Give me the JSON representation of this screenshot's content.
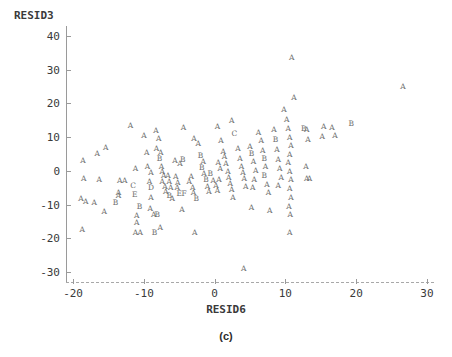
{
  "figure": {
    "caption": "(c)",
    "ylabel": "RESID3",
    "xlabel": "RESID6"
  },
  "chart_data": {
    "type": "scatter",
    "title": "",
    "subtitle": "",
    "caption": "(c)",
    "xlabel": "RESID6",
    "ylabel": "RESID3",
    "xlim": [
      -21,
      31
    ],
    "ylim": [
      -33,
      43
    ],
    "xticks": [
      -20,
      -10,
      0,
      10,
      20,
      30
    ],
    "yticks": [
      -30,
      -20,
      -10,
      0,
      10,
      20,
      30,
      40
    ],
    "xtick_labels": [
      "-20",
      "-10",
      "0",
      "10",
      "20",
      "30"
    ],
    "ytick_labels": [
      "-30",
      "-20",
      "-10",
      "0",
      "10",
      "20",
      "30",
      "40"
    ],
    "grid": false,
    "legend": "none",
    "marker_style": "letter-coded-count",
    "marker_letters": [
      "A",
      "B",
      "C",
      "D",
      "E",
      "F"
    ],
    "marker_letter_meaning": "A=1 observation, B=2, C=3, D=4, E=5, F=6 overlapping observations",
    "xaxis_style": "dashed",
    "yaxis_style": "solid",
    "points": [
      {
        "x": -18.6,
        "y": 3.0,
        "label": "A"
      },
      {
        "x": -16.6,
        "y": 5.0,
        "label": "A"
      },
      {
        "x": -15.4,
        "y": 6.8,
        "label": "A"
      },
      {
        "x": -18.5,
        "y": -2.5,
        "label": "A"
      },
      {
        "x": -16.3,
        "y": -2.7,
        "label": "A"
      },
      {
        "x": -18.9,
        "y": -8.3,
        "label": "A"
      },
      {
        "x": -18.2,
        "y": -9.3,
        "label": "A"
      },
      {
        "x": -17.0,
        "y": -9.4,
        "label": "A"
      },
      {
        "x": -15.6,
        "y": -12.3,
        "label": "A"
      },
      {
        "x": -18.7,
        "y": -17.6,
        "label": "A"
      },
      {
        "x": -13.4,
        "y": -3.0,
        "label": "A"
      },
      {
        "x": -12.7,
        "y": -3.0,
        "label": "A"
      },
      {
        "x": -13.6,
        "y": -6.5,
        "label": "A"
      },
      {
        "x": -13.6,
        "y": -7.6,
        "label": "A"
      },
      {
        "x": -14.0,
        "y": -9.4,
        "label": "B"
      },
      {
        "x": -11.2,
        "y": 0.6,
        "label": "A"
      },
      {
        "x": -11.5,
        "y": -4.6,
        "label": "C"
      },
      {
        "x": -11.3,
        "y": -7.3,
        "label": "E"
      },
      {
        "x": -10.6,
        "y": -10.8,
        "label": "B"
      },
      {
        "x": -11.0,
        "y": -13.5,
        "label": "A"
      },
      {
        "x": -11.0,
        "y": -15.6,
        "label": "A"
      },
      {
        "x": -11.2,
        "y": -18.6,
        "label": "A"
      },
      {
        "x": -10.5,
        "y": -18.6,
        "label": "A"
      },
      {
        "x": -11.9,
        "y": 13.4,
        "label": "A"
      },
      {
        "x": -10.0,
        "y": 10.2,
        "label": "A"
      },
      {
        "x": -9.6,
        "y": 5.4,
        "label": "A"
      },
      {
        "x": -9.5,
        "y": 1.0,
        "label": "A"
      },
      {
        "x": -9.0,
        "y": -0.5,
        "label": "A"
      },
      {
        "x": -9.2,
        "y": -3.2,
        "label": "A"
      },
      {
        "x": -9.0,
        "y": -5.2,
        "label": "D"
      },
      {
        "x": -9.0,
        "y": -8.2,
        "label": "A"
      },
      {
        "x": -9.1,
        "y": -11.4,
        "label": "A"
      },
      {
        "x": -8.6,
        "y": -13.0,
        "label": "A"
      },
      {
        "x": -8.1,
        "y": -13.2,
        "label": "B"
      },
      {
        "x": -8.5,
        "y": -18.5,
        "label": "B"
      },
      {
        "x": -7.7,
        "y": -17.1,
        "label": "A"
      },
      {
        "x": -8.3,
        "y": 11.7,
        "label": "A"
      },
      {
        "x": -7.9,
        "y": 9.4,
        "label": "A"
      },
      {
        "x": -8.2,
        "y": 6.4,
        "label": "A"
      },
      {
        "x": -7.6,
        "y": 5.4,
        "label": "A"
      },
      {
        "x": -7.8,
        "y": 3.4,
        "label": "B"
      },
      {
        "x": -7.5,
        "y": 1.2,
        "label": "A"
      },
      {
        "x": -7.4,
        "y": -0.2,
        "label": "A"
      },
      {
        "x": -7.2,
        "y": -1.6,
        "label": "A"
      },
      {
        "x": -7.4,
        "y": -3.2,
        "label": "A"
      },
      {
        "x": -7.0,
        "y": -4.7,
        "label": "A"
      },
      {
        "x": -6.9,
        "y": -6.2,
        "label": "A"
      },
      {
        "x": -6.6,
        "y": -1.6,
        "label": "A"
      },
      {
        "x": -6.4,
        "y": -3.3,
        "label": "A"
      },
      {
        "x": -6.2,
        "y": -5.0,
        "label": "A"
      },
      {
        "x": -6.4,
        "y": -7.4,
        "label": "B"
      },
      {
        "x": -6.0,
        "y": -8.4,
        "label": "A"
      },
      {
        "x": -5.5,
        "y": -1.8,
        "label": "A"
      },
      {
        "x": -5.2,
        "y": -3.6,
        "label": "A"
      },
      {
        "x": -5.3,
        "y": -5.2,
        "label": "A"
      },
      {
        "x": -5.0,
        "y": -6.8,
        "label": "E"
      },
      {
        "x": -4.3,
        "y": -6.8,
        "label": "F"
      },
      {
        "x": -5.6,
        "y": 3.0,
        "label": "A"
      },
      {
        "x": -4.9,
        "y": 1.9,
        "label": "A"
      },
      {
        "x": -4.5,
        "y": 3.2,
        "label": "B"
      },
      {
        "x": -4.4,
        "y": 12.6,
        "label": "A"
      },
      {
        "x": -4.6,
        "y": -11.6,
        "label": "A"
      },
      {
        "x": -3.6,
        "y": -3.3,
        "label": "A"
      },
      {
        "x": -3.3,
        "y": -1.8,
        "label": "A"
      },
      {
        "x": -3.1,
        "y": -5.0,
        "label": "A"
      },
      {
        "x": -3.0,
        "y": -6.6,
        "label": "A"
      },
      {
        "x": -2.6,
        "y": -8.3,
        "label": "B"
      },
      {
        "x": -2.8,
        "y": -18.6,
        "label": "A"
      },
      {
        "x": -2.9,
        "y": 9.6,
        "label": "A"
      },
      {
        "x": -2.3,
        "y": 8.1,
        "label": "A"
      },
      {
        "x": -2.0,
        "y": 4.4,
        "label": "B"
      },
      {
        "x": -1.6,
        "y": 2.6,
        "label": "A"
      },
      {
        "x": -1.8,
        "y": 0.8,
        "label": "B"
      },
      {
        "x": -1.5,
        "y": -1.0,
        "label": "A"
      },
      {
        "x": -1.2,
        "y": -2.8,
        "label": "B"
      },
      {
        "x": -1.0,
        "y": -4.8,
        "label": "A"
      },
      {
        "x": -0.8,
        "y": -6.4,
        "label": "A"
      },
      {
        "x": -0.6,
        "y": -0.9,
        "label": "B"
      },
      {
        "x": -0.2,
        "y": -2.9,
        "label": "A"
      },
      {
        "x": 0.2,
        "y": -4.4,
        "label": "A"
      },
      {
        "x": 0.4,
        "y": -6.0,
        "label": "A"
      },
      {
        "x": 0.6,
        "y": -2.6,
        "label": "A"
      },
      {
        "x": 0.8,
        "y": 0.4,
        "label": "A"
      },
      {
        "x": 0.5,
        "y": 2.2,
        "label": "A"
      },
      {
        "x": 0.4,
        "y": 13.0,
        "label": "A"
      },
      {
        "x": 0.9,
        "y": 9.0,
        "label": "A"
      },
      {
        "x": 1.2,
        "y": 5.6,
        "label": "A"
      },
      {
        "x": 1.4,
        "y": 4.0,
        "label": "A"
      },
      {
        "x": 1.6,
        "y": 1.9,
        "label": "A"
      },
      {
        "x": 1.9,
        "y": -0.4,
        "label": "A"
      },
      {
        "x": 2.0,
        "y": -2.0,
        "label": "A"
      },
      {
        "x": 2.2,
        "y": -3.8,
        "label": "A"
      },
      {
        "x": 2.4,
        "y": -5.8,
        "label": "A"
      },
      {
        "x": 2.6,
        "y": -8.2,
        "label": "A"
      },
      {
        "x": 2.4,
        "y": 14.8,
        "label": "A"
      },
      {
        "x": 2.8,
        "y": 11.0,
        "label": "C"
      },
      {
        "x": 3.3,
        "y": 6.4,
        "label": "A"
      },
      {
        "x": 3.6,
        "y": 3.4,
        "label": "A"
      },
      {
        "x": 3.8,
        "y": 1.2,
        "label": "A"
      },
      {
        "x": 4.0,
        "y": -0.6,
        "label": "A"
      },
      {
        "x": 4.2,
        "y": -2.4,
        "label": "A"
      },
      {
        "x": 4.4,
        "y": -4.8,
        "label": "A"
      },
      {
        "x": 4.1,
        "y": -29.2,
        "label": "A"
      },
      {
        "x": 5.0,
        "y": 7.2,
        "label": "A"
      },
      {
        "x": 5.2,
        "y": 5.0,
        "label": "B"
      },
      {
        "x": 5.5,
        "y": 2.5,
        "label": "A"
      },
      {
        "x": 5.8,
        "y": 0.0,
        "label": "A"
      },
      {
        "x": 5.6,
        "y": -2.6,
        "label": "A"
      },
      {
        "x": 5.4,
        "y": -5.2,
        "label": "A"
      },
      {
        "x": 5.2,
        "y": -11.0,
        "label": "A"
      },
      {
        "x": 6.2,
        "y": 11.2,
        "label": "A"
      },
      {
        "x": 6.6,
        "y": 8.8,
        "label": "A"
      },
      {
        "x": 6.8,
        "y": 6.0,
        "label": "A"
      },
      {
        "x": 7.0,
        "y": 3.6,
        "label": "B"
      },
      {
        "x": 7.2,
        "y": 1.0,
        "label": "A"
      },
      {
        "x": 7.0,
        "y": -1.6,
        "label": "B"
      },
      {
        "x": 7.4,
        "y": -4.2,
        "label": "A"
      },
      {
        "x": 7.6,
        "y": -6.6,
        "label": "A"
      },
      {
        "x": 7.8,
        "y": -12.0,
        "label": "A"
      },
      {
        "x": 8.4,
        "y": 12.2,
        "label": "A"
      },
      {
        "x": 8.6,
        "y": 9.2,
        "label": "B"
      },
      {
        "x": 8.8,
        "y": 6.2,
        "label": "A"
      },
      {
        "x": 9.0,
        "y": 3.2,
        "label": "A"
      },
      {
        "x": 9.2,
        "y": 0.4,
        "label": "A"
      },
      {
        "x": 9.4,
        "y": -2.2,
        "label": "A"
      },
      {
        "x": 9.0,
        "y": -4.6,
        "label": "A"
      },
      {
        "x": 9.8,
        "y": 18.2,
        "label": "A"
      },
      {
        "x": 10.2,
        "y": 15.0,
        "label": "A"
      },
      {
        "x": 10.4,
        "y": 12.4,
        "label": "A"
      },
      {
        "x": 10.6,
        "y": 9.8,
        "label": "A"
      },
      {
        "x": 10.8,
        "y": 7.4,
        "label": "A"
      },
      {
        "x": 10.6,
        "y": 4.8,
        "label": "A"
      },
      {
        "x": 10.4,
        "y": 2.2,
        "label": "A"
      },
      {
        "x": 10.6,
        "y": -0.2,
        "label": "A"
      },
      {
        "x": 10.8,
        "y": -2.8,
        "label": "A"
      },
      {
        "x": 10.6,
        "y": -5.4,
        "label": "A"
      },
      {
        "x": 10.8,
        "y": -8.0,
        "label": "A"
      },
      {
        "x": 10.5,
        "y": -10.6,
        "label": "A"
      },
      {
        "x": 10.7,
        "y": -13.0,
        "label": "A"
      },
      {
        "x": 10.6,
        "y": -18.4,
        "label": "A"
      },
      {
        "x": 10.9,
        "y": 33.4,
        "label": "A"
      },
      {
        "x": 11.2,
        "y": 21.6,
        "label": "A"
      },
      {
        "x": 12.6,
        "y": 12.4,
        "label": "B"
      },
      {
        "x": 13.0,
        "y": 12.2,
        "label": "A"
      },
      {
        "x": 13.2,
        "y": 9.2,
        "label": "A"
      },
      {
        "x": 12.9,
        "y": 1.2,
        "label": "A"
      },
      {
        "x": 13.0,
        "y": -2.4,
        "label": "A"
      },
      {
        "x": 13.4,
        "y": -2.4,
        "label": "A"
      },
      {
        "x": 15.2,
        "y": 10.0,
        "label": "A"
      },
      {
        "x": 15.4,
        "y": 13.0,
        "label": "A"
      },
      {
        "x": 16.6,
        "y": 12.6,
        "label": "A"
      },
      {
        "x": 17.0,
        "y": 10.2,
        "label": "A"
      },
      {
        "x": 19.3,
        "y": 14.0,
        "label": "B"
      },
      {
        "x": 26.6,
        "y": 25.0,
        "label": "A"
      }
    ]
  }
}
